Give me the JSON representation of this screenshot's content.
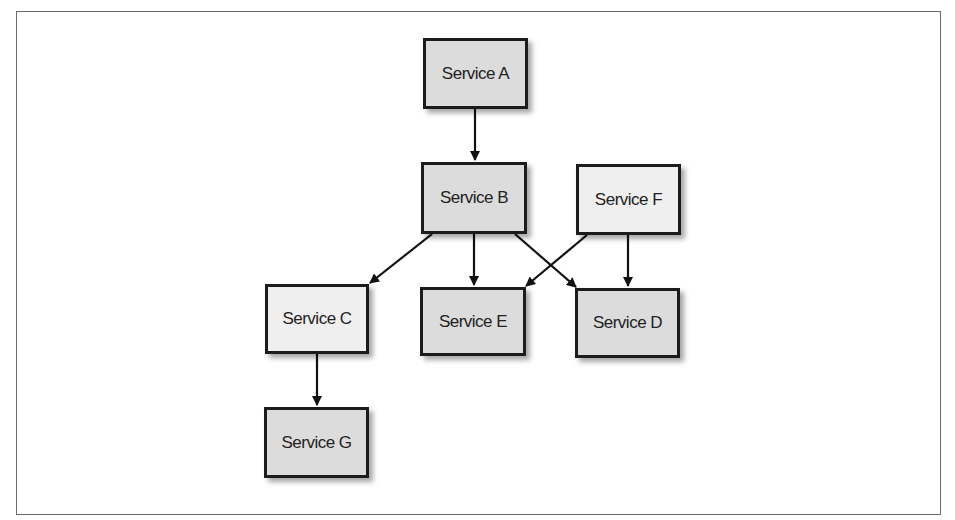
{
  "diagram": {
    "type": "service dependency graph",
    "nodes": [
      {
        "id": "A",
        "label": "Service A",
        "x": 423,
        "y": 38,
        "w": 105,
        "h": 71,
        "fill": "dark"
      },
      {
        "id": "B",
        "label": "Service B",
        "x": 421,
        "y": 162,
        "w": 106,
        "h": 72,
        "fill": "dark"
      },
      {
        "id": "F",
        "label": "Service F",
        "x": 576,
        "y": 164,
        "w": 105,
        "h": 71,
        "fill": "light"
      },
      {
        "id": "C",
        "label": "Service C",
        "x": 265,
        "y": 284,
        "w": 104,
        "h": 70,
        "fill": "light"
      },
      {
        "id": "E",
        "label": "Service E",
        "x": 420,
        "y": 287,
        "w": 106,
        "h": 69,
        "fill": "dark"
      },
      {
        "id": "D",
        "label": "Service D",
        "x": 575,
        "y": 288,
        "w": 105,
        "h": 70,
        "fill": "dark"
      },
      {
        "id": "G",
        "label": "Service G",
        "x": 264,
        "y": 407,
        "w": 105,
        "h": 71,
        "fill": "dark"
      }
    ],
    "edges": [
      {
        "from": "A",
        "to": "B"
      },
      {
        "from": "B",
        "to": "C"
      },
      {
        "from": "B",
        "to": "E"
      },
      {
        "from": "B",
        "to": "D"
      },
      {
        "from": "F",
        "to": "E"
      },
      {
        "from": "F",
        "to": "D"
      },
      {
        "from": "C",
        "to": "G"
      }
    ],
    "colors": {
      "node_dark": "#dcdcdc",
      "node_light": "#efefef",
      "stroke": "#1c1c1c",
      "frame": "#6b6b6b"
    }
  }
}
